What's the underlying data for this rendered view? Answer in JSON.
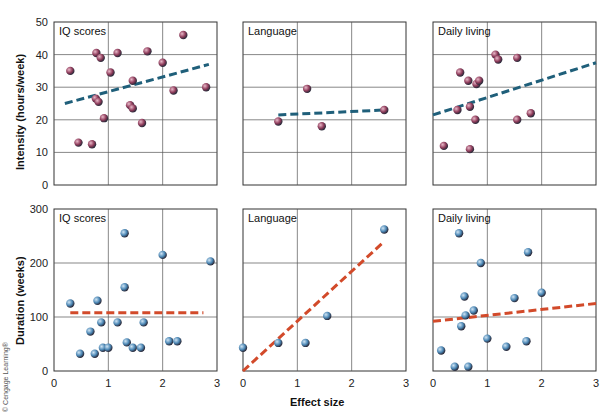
{
  "figure": {
    "ylabel_top": "Intensity (hours/week)",
    "ylabel_bottom": "Duration (weeks)",
    "xlabel": "Effect size",
    "credit": "© Cengage Learning®",
    "colors": {
      "top_points": "#8e3b5a",
      "top_trend": "#1f5f7a",
      "bottom_points": "#4a86b4",
      "bottom_trend": "#d24a2a",
      "grid": "#555555"
    }
  },
  "chart_data": [
    {
      "type": "scatter",
      "title": "IQ scores",
      "row": 0,
      "col": 0,
      "xlabel": "",
      "ylabel": "Intensity (hours/week)",
      "xlim": [
        0,
        3
      ],
      "ylim": [
        0,
        50
      ],
      "yticks": [
        0,
        10,
        20,
        30,
        40,
        50
      ],
      "xticks": [],
      "points": [
        [
          0.3,
          35
        ],
        [
          0.45,
          13
        ],
        [
          0.7,
          12.5
        ],
        [
          0.77,
          26.5
        ],
        [
          0.78,
          40.5
        ],
        [
          0.82,
          25.5
        ],
        [
          0.86,
          39
        ],
        [
          0.92,
          20.5
        ],
        [
          1.04,
          34.5
        ],
        [
          1.17,
          40.5
        ],
        [
          1.4,
          24.5
        ],
        [
          1.45,
          23.5
        ],
        [
          1.45,
          32
        ],
        [
          1.62,
          19
        ],
        [
          1.72,
          41
        ],
        [
          2.0,
          37.5
        ],
        [
          2.2,
          29
        ],
        [
          2.38,
          46
        ],
        [
          2.8,
          30
        ]
      ],
      "trend": [
        [
          0.2,
          25
        ],
        [
          2.85,
          37
        ]
      ]
    },
    {
      "type": "scatter",
      "title": "Language",
      "row": 0,
      "col": 1,
      "xlim": [
        0,
        3
      ],
      "ylim": [
        0,
        50
      ],
      "yticks": [],
      "xticks": [],
      "points": [
        [
          0.65,
          19.5
        ],
        [
          1.18,
          29.5
        ],
        [
          1.45,
          18
        ],
        [
          2.6,
          23
        ]
      ],
      "trend": [
        [
          0.65,
          21.5
        ],
        [
          2.6,
          23
        ]
      ]
    },
    {
      "type": "scatter",
      "title": "Daily living",
      "row": 0,
      "col": 2,
      "xlim": [
        0,
        3
      ],
      "ylim": [
        0,
        50
      ],
      "yticks": [],
      "xticks": [],
      "points": [
        [
          0.2,
          12
        ],
        [
          0.45,
          23
        ],
        [
          0.5,
          34.5
        ],
        [
          0.65,
          32
        ],
        [
          0.68,
          24
        ],
        [
          0.68,
          11
        ],
        [
          0.78,
          20
        ],
        [
          0.8,
          31
        ],
        [
          0.85,
          32
        ],
        [
          1.15,
          40
        ],
        [
          1.2,
          38.5
        ],
        [
          1.55,
          39
        ],
        [
          1.55,
          20
        ],
        [
          1.8,
          22
        ]
      ],
      "trend": [
        [
          0,
          21.5
        ],
        [
          3,
          37.5
        ]
      ]
    },
    {
      "type": "scatter",
      "title": "IQ scores",
      "row": 1,
      "col": 0,
      "xlabel": "",
      "ylabel": "Duration (weeks)",
      "xlim": [
        0,
        3
      ],
      "ylim": [
        0,
        300
      ],
      "yticks": [
        0,
        100,
        200,
        300
      ],
      "xticks": [
        0,
        1,
        2,
        3
      ],
      "points": [
        [
          0.3,
          125
        ],
        [
          0.48,
          32
        ],
        [
          0.67,
          73
        ],
        [
          0.75,
          32
        ],
        [
          0.8,
          130
        ],
        [
          0.87,
          90
        ],
        [
          0.9,
          43
        ],
        [
          1.0,
          43
        ],
        [
          1.17,
          90
        ],
        [
          1.3,
          255
        ],
        [
          1.3,
          155
        ],
        [
          1.34,
          53
        ],
        [
          1.45,
          43
        ],
        [
          1.6,
          43
        ],
        [
          1.65,
          90
        ],
        [
          2.0,
          215
        ],
        [
          2.12,
          55
        ],
        [
          2.27,
          55
        ],
        [
          2.88,
          203
        ]
      ],
      "trend": [
        [
          0.3,
          108
        ],
        [
          2.75,
          108
        ]
      ]
    },
    {
      "type": "scatter",
      "title": "Language",
      "row": 1,
      "col": 1,
      "xlabel": "Effect size",
      "xlim": [
        0,
        3
      ],
      "ylim": [
        0,
        300
      ],
      "yticks": [],
      "xticks": [
        0,
        1,
        2,
        3
      ],
      "points": [
        [
          0.0,
          43
        ],
        [
          0.65,
          52
        ],
        [
          1.15,
          52
        ],
        [
          1.55,
          102
        ],
        [
          2.6,
          262
        ]
      ],
      "trend": [
        [
          0,
          0
        ],
        [
          2.6,
          240
        ]
      ]
    },
    {
      "type": "scatter",
      "title": "Daily living",
      "row": 1,
      "col": 2,
      "xlim": [
        0,
        3
      ],
      "ylim": [
        0,
        300
      ],
      "yticks": [],
      "xticks": [
        0,
        1,
        2,
        3
      ],
      "points": [
        [
          0.15,
          38
        ],
        [
          0.4,
          8
        ],
        [
          0.48,
          255
        ],
        [
          0.52,
          83
        ],
        [
          0.58,
          138
        ],
        [
          0.6,
          103
        ],
        [
          0.65,
          8
        ],
        [
          0.75,
          112
        ],
        [
          0.88,
          200
        ],
        [
          1.0,
          60
        ],
        [
          1.35,
          45
        ],
        [
          1.5,
          135
        ],
        [
          1.72,
          55
        ],
        [
          1.75,
          220
        ],
        [
          2.0,
          145
        ]
      ],
      "trend": [
        [
          0,
          92
        ],
        [
          3,
          125
        ]
      ]
    }
  ]
}
